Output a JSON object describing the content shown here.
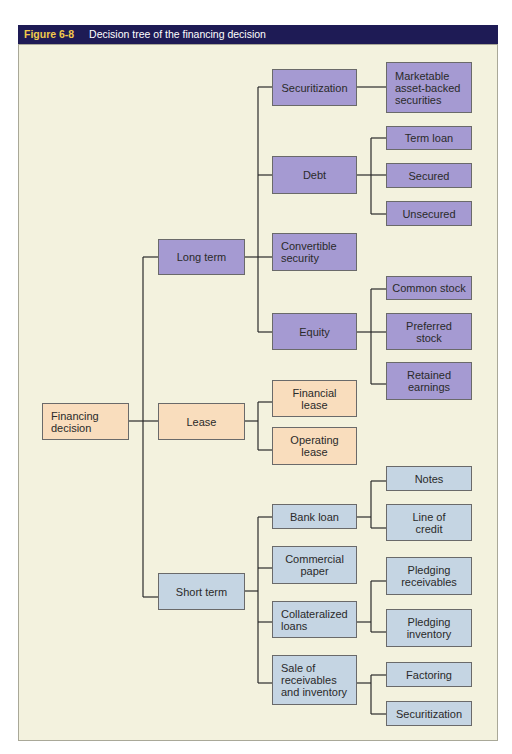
{
  "figure": {
    "number": "Figure 6-8",
    "title": "Decision tree of the financing decision"
  },
  "colors": {
    "header_bg": "#1e1b55",
    "panel_bg": "#f3f2de",
    "long_term": "#a59ad2",
    "lease": "#f9ddbd",
    "short_term": "#c5d5e3"
  },
  "tree": {
    "root": "Financing decision",
    "level1": {
      "long_term": "Long term",
      "lease": "Lease",
      "short_term": "Short term"
    },
    "long_term": {
      "securitization": "Securitization",
      "securitization_children": [
        "Marketable asset-backed securities"
      ],
      "debt": "Debt",
      "debt_children": [
        "Term loan",
        "Secured",
        "Unsecured"
      ],
      "convertible": "Convertible security",
      "equity": "Equity",
      "equity_children": [
        "Common stock",
        "Preferred stock",
        "Retained earnings"
      ]
    },
    "lease": {
      "children": [
        "Financial lease",
        "Operating lease"
      ]
    },
    "short_term": {
      "bank_loan": "Bank loan",
      "bank_loan_children": [
        "Notes",
        "Line of credit"
      ],
      "commercial_paper": "Commercial paper",
      "collateralized": "Collateralized loans",
      "collateralized_children": [
        "Pledging receivables",
        "Pledging inventory"
      ],
      "sale": "Sale of receivables and inventory",
      "sale_children": [
        "Factoring",
        "Securitization"
      ]
    }
  }
}
